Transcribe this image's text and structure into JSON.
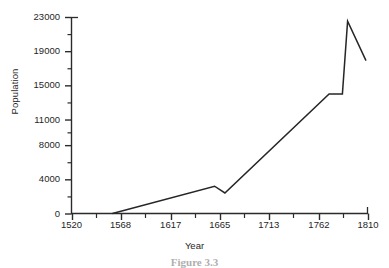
{
  "chart_data": {
    "type": "line",
    "title": "",
    "xlabel": "Year",
    "ylabel": "Population",
    "xlim": [
      1520,
      1810
    ],
    "ylim": [
      0,
      23000
    ],
    "grid": false,
    "legend": null,
    "x_tick_labels": [
      "1520",
      "1568",
      "1617",
      "1665",
      "1713",
      "1762",
      "1810"
    ],
    "x_ticks": [
      1520,
      1568,
      1617,
      1665,
      1713,
      1762,
      1810
    ],
    "y_tick_labels": [
      "0",
      "4000",
      "8000",
      "11000",
      "15000",
      "19000",
      "23000"
    ],
    "y_ticks": [
      0,
      4000,
      8000,
      11000,
      15000,
      19000,
      23000
    ],
    "x_minor_ticks": [
      1544,
      1592,
      1641,
      1689,
      1737,
      1786
    ],
    "y_minor_ticks": [
      2000,
      6000,
      9500,
      13000,
      17000,
      21000
    ],
    "series": [
      {
        "name": "Population",
        "points": [
          {
            "x": 1560,
            "y": 0
          },
          {
            "x": 1660,
            "y": 3200
          },
          {
            "x": 1670,
            "y": 2400
          },
          {
            "x": 1772,
            "y": 14000
          },
          {
            "x": 1785,
            "y": 14000
          },
          {
            "x": 1790,
            "y": 22500
          },
          {
            "x": 1808,
            "y": 17900
          }
        ]
      }
    ]
  },
  "axes": {
    "y_axis_name": "population-axis",
    "x_axis_name": "year-axis"
  },
  "caption": {
    "text": "Figure 3.3"
  }
}
